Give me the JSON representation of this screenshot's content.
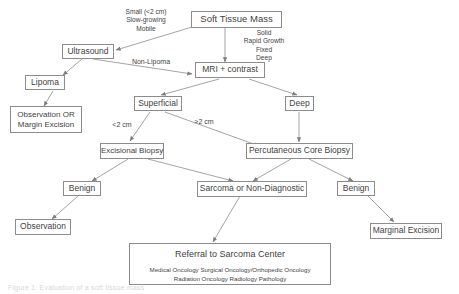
{
  "diagram": {
    "accent_color": "#8c8c8c",
    "text_color": "#3f3f3f",
    "background_color": "#ffffff",
    "nodes": {
      "soft_tissue_mass": "Soft Tissue Mass",
      "ultrasound": "Ultrasound",
      "lipoma": "Lipoma",
      "observation_or_margin_excision_line1": "Observation OR",
      "observation_or_margin_excision_line2": "Margin Excision",
      "mri_contrast": "MRI + contrast",
      "superficial": "Superficial",
      "deep": "Deep",
      "excisional_biopsy": "Excisional Biopsy",
      "percutaneous_core_biopsy": "Percutaneous Core Biopsy",
      "benign_left": "Benign",
      "benign_right": "Benign",
      "sarcoma_or_non_diagnostic": "Sarcoma or Non-Diagnostic",
      "observation": "Observation",
      "marginal_excision": "Marginal Excision",
      "referral_title": "Referral to Sarcoma Center",
      "referral_specialties_line1": "Medical Oncology   Surgical Oncology/Orthopedic Oncology",
      "referral_specialties_line2": "Radiation Oncology   Radiology     Pathology"
    },
    "edge_labels": {
      "small_criteria_line1": "Small (<2 cm)",
      "small_criteria_line2": "Slow-growing",
      "small_criteria_line3": "Mobile",
      "aggressive_criteria_line1": "Solid",
      "aggressive_criteria_line2": "Rapid Growth",
      "aggressive_criteria_line3": "Fixed",
      "aggressive_criteria_line4": "Deep",
      "non_lipoma": "Non-Lipoma",
      "less_than_2cm": "<2 cm",
      "greater_than_2cm": ">2 cm"
    },
    "caption": "Figure 1. Evaluation of a soft tissue mass"
  }
}
